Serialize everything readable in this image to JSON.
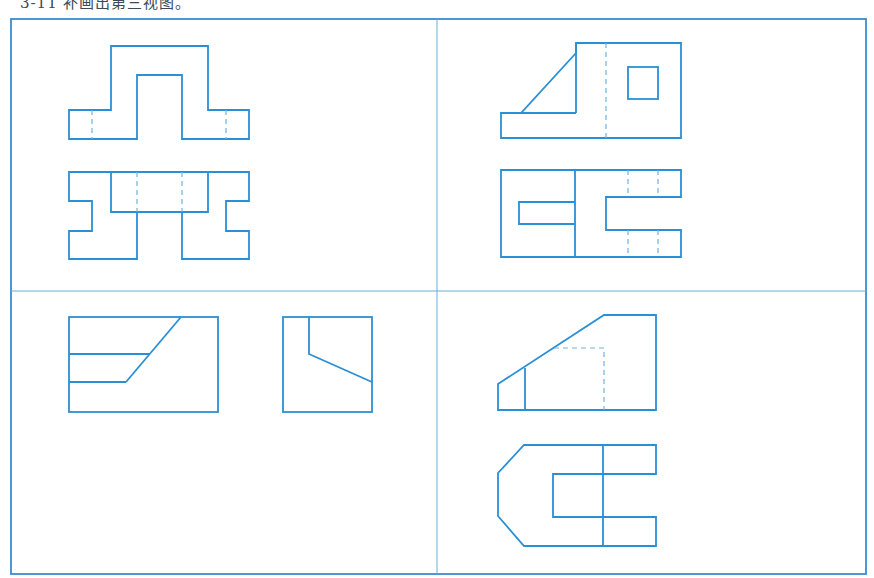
{
  "caption": "3-11 补画出第三视图。",
  "colors": {
    "line": "#2a8fd6",
    "hidden_line": "#6fb3e3",
    "frame": "#3a8ccf"
  },
  "panels": [
    {
      "id": "a",
      "description": "Two views: front view of arch over base with hidden lines; top view with notches"
    },
    {
      "id": "b",
      "description": "Two views: front view with sloped rib and square hole; top view with slot and C-shaped cutout"
    },
    {
      "id": "c",
      "description": "Two views side by side: front view with stepped slope; side view with sloped cut"
    },
    {
      "id": "d",
      "description": "Two views: front view with sloped top and hidden lines; top view chamfered C-shape"
    }
  ]
}
